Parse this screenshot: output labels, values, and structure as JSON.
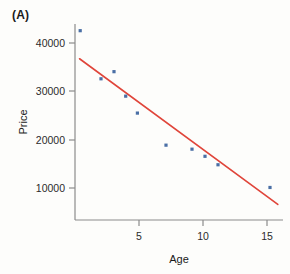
{
  "panel": {
    "label": "(A)"
  },
  "chart_data": {
    "type": "scatter",
    "title": "",
    "xlabel": "Age",
    "ylabel": "Price",
    "xlim": [
      0,
      16
    ],
    "ylim": [
      0,
      44000
    ],
    "xticks": [
      5,
      10,
      15
    ],
    "xticklabels": [
      "5",
      "10",
      "15"
    ],
    "yticks": [
      10000,
      20000,
      30000,
      40000
    ],
    "yticklabels": [
      "10000",
      "20000",
      "30000",
      "40000"
    ],
    "grid": false,
    "legend": null,
    "point_color": "#4a6fa5",
    "line_color": "#e0453a",
    "axis_color": "#8c8c8c",
    "series": [
      {
        "name": "observations",
        "type": "scatter",
        "x": [
          0.4,
          2.0,
          3.0,
          3.9,
          4.8,
          7.0,
          9.0,
          10.0,
          11.0,
          15.0
        ],
        "y": [
          42500,
          31700,
          33300,
          27800,
          24000,
          16800,
          15900,
          14300,
          12400,
          7300
        ]
      },
      {
        "name": "fitted regression line",
        "type": "line",
        "x": [
          0.35,
          15.6
        ],
        "y": [
          36200,
          3500
        ]
      }
    ]
  }
}
